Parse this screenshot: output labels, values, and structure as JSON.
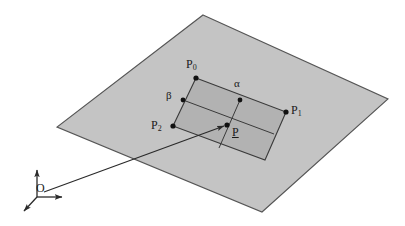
{
  "figure": {
    "type": "geometry-diagram",
    "background_color": "#ffffff",
    "plane": {
      "name": "support-plane",
      "fill_color": "#c4c4c4",
      "stroke_color": "#555555",
      "vertices": [
        [
          203,
          15
        ],
        [
          388,
          99
        ],
        [
          262,
          212
        ],
        [
          57,
          127
        ]
      ]
    },
    "patch": {
      "name": "inner-quad",
      "fill_color": "#b2b2b2",
      "stroke_color": "#3a3a3a",
      "vertices": [
        [
          196,
          78
        ],
        [
          286,
          112
        ],
        [
          265,
          160
        ],
        [
          173,
          126
        ]
      ]
    },
    "subdivision_lines": [
      {
        "name": "beta-line",
        "from": [
          183,
          100
        ],
        "to": [
          274,
          134
        ]
      },
      {
        "name": "alpha-line",
        "from": [
          240,
          100
        ],
        "to": [
          219,
          148
        ]
      }
    ],
    "points": [
      {
        "id": "P0",
        "label": "P",
        "sub": "0",
        "x": 196,
        "y": 78,
        "label_x": 188,
        "label_y": 60
      },
      {
        "id": "P1",
        "label": "P",
        "sub": "1",
        "x": 286,
        "y": 112,
        "label_x": 292,
        "label_y": 106
      },
      {
        "id": "P2",
        "label": "P",
        "sub": "2",
        "x": 173,
        "y": 126,
        "label_x": 152,
        "label_y": 121
      },
      {
        "id": "Palpha",
        "label": "",
        "sub": "",
        "x": 240,
        "y": 100,
        "label_x": 0,
        "label_y": 0
      },
      {
        "id": "Pbeta",
        "label": "",
        "sub": "",
        "x": 183,
        "y": 100,
        "label_x": 0,
        "label_y": 0
      },
      {
        "id": "P",
        "label": "P",
        "sub": "",
        "x": 227,
        "y": 125,
        "label_x": 232,
        "label_y": 127
      }
    ],
    "parameter_labels": [
      {
        "name": "alpha-label",
        "text": "α",
        "x": 234,
        "y": 79
      },
      {
        "name": "beta-label",
        "text": "β",
        "x": 167,
        "y": 92
      }
    ],
    "position_vector": {
      "name": "position-vector-O-to-P",
      "from": [
        44,
        192
      ],
      "to": [
        227,
        125
      ],
      "stroke_color": "#2a2a2a"
    },
    "origin": {
      "name": "origin-frame",
      "label": "O",
      "label_x": 36,
      "label_y": 182,
      "center": [
        37,
        197
      ],
      "axes": [
        {
          "name": "axis-up",
          "to": [
            37,
            166
          ]
        },
        {
          "name": "axis-right",
          "to": [
            66,
            197
          ]
        },
        {
          "name": "axis-depth",
          "to": [
            21,
            213
          ]
        }
      ],
      "stroke_color": "#2a2a2a"
    }
  }
}
